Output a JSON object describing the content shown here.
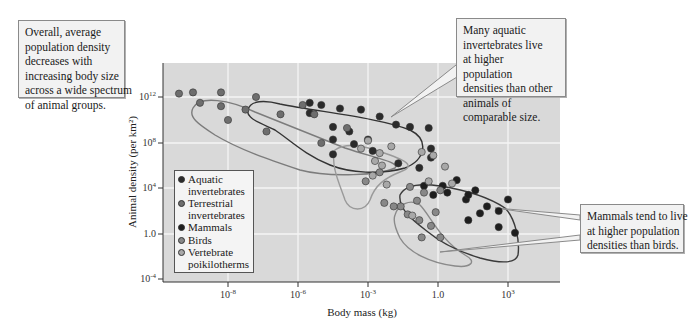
{
  "callouts": {
    "left": [
      "Overall, average",
      "population density",
      "decreases with",
      "increasing body size",
      "across a wide spectrum",
      "of animal groups."
    ],
    "top": [
      "Many aquatic",
      "invertebrates live",
      "at higher",
      "population",
      "densities than other",
      "animals of",
      "comparable size."
    ],
    "right": [
      "Mammals tend to live",
      "at higher population",
      "densities than birds."
    ]
  },
  "legend": {
    "items": [
      {
        "label1": "Aquatic",
        "label2": "invertebrates",
        "color": "#2b2b2b"
      },
      {
        "label1": "Terrestrial",
        "label2": "invertebrates",
        "color": "#6e6e6e"
      },
      {
        "label1": "Mammals",
        "label2": "",
        "color": "#1e1e1e"
      },
      {
        "label1": "Birds",
        "label2": "",
        "color": "#888888"
      },
      {
        "label1": "Vertebrate",
        "label2": "poikilotherms",
        "color": "#a8a8a8"
      }
    ]
  },
  "chart_data": {
    "type": "scatter",
    "title": "",
    "xlabel": "Body mass (kg)",
    "ylabel": "Animal density (per km²)",
    "x_scale": "log",
    "y_scale": "log",
    "x_ticks": [
      {
        "base": "10",
        "exp": "-8"
      },
      {
        "base": "10",
        "exp": "-6"
      },
      {
        "base": "10",
        "exp": "-3"
      },
      {
        "base": "1.0",
        "exp": ""
      },
      {
        "base": "10",
        "exp": "3"
      }
    ],
    "y_ticks": [
      {
        "base": "10",
        "exp": "12"
      },
      {
        "base": "10",
        "exp": "8"
      },
      {
        "base": "10",
        "exp": "4"
      },
      {
        "base": "1.0",
        "exp": ""
      },
      {
        "base": "10",
        "exp": "-4"
      }
    ],
    "xlim_log10": [
      -10,
      5
    ],
    "ylim_log10": [
      -4,
      15
    ],
    "grid": true,
    "legend_position": "lower-left inside",
    "series": [
      {
        "name": "Aquatic invertebrates",
        "color": "#2b2b2b",
        "points_log10": [
          [
            -5.5,
            11.5
          ],
          [
            -5.0,
            11.3
          ],
          [
            -4.2,
            11.0
          ],
          [
            -3.3,
            10.9
          ],
          [
            -2.5,
            10.3
          ],
          [
            -1.8,
            9.6
          ],
          [
            -1.2,
            9.4
          ],
          [
            -0.4,
            9.3
          ],
          [
            -5.5,
            10.6
          ],
          [
            -4.5,
            9.4
          ],
          [
            -3.8,
            9.0
          ],
          [
            -4.5,
            8.3
          ],
          [
            -3.6,
            7.9
          ],
          [
            -3.0,
            8.3
          ],
          [
            -2.8,
            7.3
          ],
          [
            -4.5,
            7.0
          ],
          [
            -0.3,
            7.5
          ],
          [
            -0.3,
            6.7
          ],
          [
            -1.7,
            6.2
          ],
          [
            -0.8,
            5.8
          ]
        ]
      },
      {
        "name": "Terrestrial invertebrates",
        "color": "#6e6e6e",
        "points_log10": [
          [
            -9.4,
            12.3
          ],
          [
            -9.0,
            12.4
          ],
          [
            -8.2,
            12.4
          ],
          [
            -7.2,
            12.0
          ],
          [
            -8.8,
            11.5
          ],
          [
            -8.2,
            11.2
          ],
          [
            -7.5,
            10.9
          ],
          [
            -8.0,
            10.0
          ],
          [
            -6.5,
            10.5
          ],
          [
            -5.8,
            11.3
          ],
          [
            -5.3,
            10.5
          ],
          [
            -6.9,
            9.0
          ],
          [
            -5.0,
            8.0
          ],
          [
            -3.9,
            9.3
          ]
        ]
      },
      {
        "name": "Mammals",
        "color": "#1e1e1e",
        "points_log10": [
          [
            0.2,
            4.2
          ],
          [
            0.8,
            4.7
          ],
          [
            1.2,
            3.0
          ],
          [
            -0.6,
            4.2
          ],
          [
            -0.2,
            3.4
          ],
          [
            0.4,
            3.6
          ],
          [
            1.6,
            3.8
          ],
          [
            2.1,
            2.4
          ],
          [
            2.6,
            2.0
          ],
          [
            3.0,
            3.0
          ],
          [
            2.6,
            0.6
          ],
          [
            3.3,
            0.1
          ],
          [
            1.3,
            1.2
          ],
          [
            1.8,
            1.8
          ],
          [
            1.3,
            3.4
          ]
        ]
      },
      {
        "name": "Birds",
        "color": "#888888",
        "points_log10": [
          [
            -2.5,
            5.4
          ],
          [
            -3.1,
            4.6
          ],
          [
            -1.2,
            4.1
          ],
          [
            -0.6,
            3.6
          ],
          [
            0.1,
            3.8
          ],
          [
            -0.9,
            2.9
          ],
          [
            -2.3,
            2.7
          ],
          [
            -1.6,
            2.4
          ],
          [
            -1.9,
            2.4
          ],
          [
            -1.3,
            1.7
          ],
          [
            -0.8,
            1.2
          ],
          [
            -0.1,
            1.9
          ],
          [
            -0.3,
            0.7
          ],
          [
            -0.7,
            -0.3
          ],
          [
            0.1,
            -0.3
          ]
        ]
      },
      {
        "name": "Vertebrate poikilotherms",
        "color": "#a8a8a8",
        "points_log10": [
          [
            -3.3,
            7.5
          ],
          [
            -3.0,
            8.2
          ],
          [
            -2.5,
            7.1
          ],
          [
            -2.0,
            7.7
          ],
          [
            -2.7,
            6.4
          ],
          [
            -2.4,
            6.0
          ],
          [
            -2.8,
            5.1
          ],
          [
            -2.2,
            4.3
          ],
          [
            -0.7,
            7.2
          ],
          [
            -0.2,
            6.9
          ],
          [
            0.3,
            5.9
          ],
          [
            -0.4,
            4.6
          ],
          [
            0.6,
            4.4
          ],
          [
            -1.1,
            1.6
          ]
        ]
      }
    ]
  }
}
